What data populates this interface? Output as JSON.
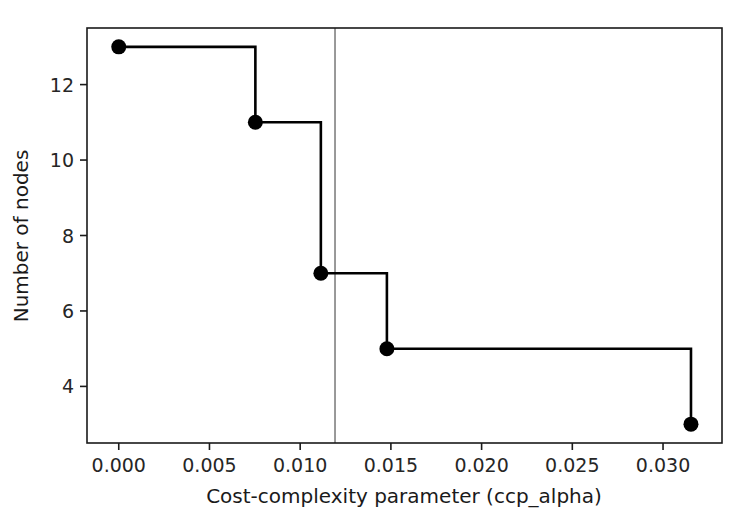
{
  "chart_data": {
    "type": "line",
    "style": "step-post",
    "title": "",
    "xlabel": "Cost-complexity parameter (ccp_alpha)",
    "ylabel": "Number of nodes",
    "x": [
      0.0,
      0.00753,
      0.01114,
      0.01478,
      0.03154
    ],
    "values": [
      13,
      11,
      7,
      5,
      3
    ],
    "series": [
      {
        "name": "Number of nodes",
        "x": [
          0.0,
          0.00753,
          0.01114,
          0.01478,
          0.03154
        ],
        "values": [
          13,
          11,
          7,
          5,
          3
        ],
        "color": "#000000",
        "marker": "o",
        "drawstyle": "steps-post"
      }
    ],
    "xlim": [
      -0.00175,
      0.03325
    ],
    "ylim": [
      2.5,
      13.5
    ],
    "xticks": [
      0.0,
      0.005,
      0.01,
      0.015,
      0.02,
      0.025,
      0.03
    ],
    "xticklabels": [
      "0.000",
      "0.005",
      "0.010",
      "0.015",
      "0.020",
      "0.025",
      "0.030"
    ],
    "yticks": [
      4,
      6,
      8,
      10,
      12
    ],
    "yticklabels": [
      "4",
      "6",
      "8",
      "10",
      "12"
    ],
    "grid": false,
    "legend": null,
    "annotations": [
      {
        "type": "vline",
        "name": "selected-alpha-line",
        "x": 0.01192,
        "color": "#808080",
        "linewidth": 1.6
      }
    ],
    "axes_frame": {
      "top": true,
      "right": true,
      "bottom": true,
      "left": true,
      "color": "#1a1a1a"
    }
  },
  "axis": {
    "xlabel": "Cost-complexity parameter (ccp_alpha)",
    "ylabel": "Number of nodes"
  }
}
